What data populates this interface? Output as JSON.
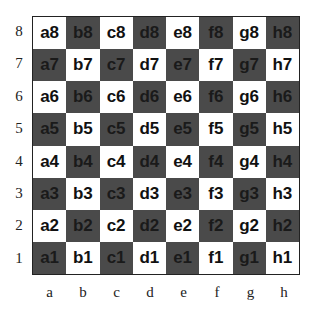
{
  "colors": {
    "light": "#ffffff",
    "dark": "#4a4a4a",
    "border": "#222222"
  },
  "ranks": [
    "8",
    "7",
    "6",
    "5",
    "4",
    "3",
    "2",
    "1"
  ],
  "files": [
    "a",
    "b",
    "c",
    "d",
    "e",
    "f",
    "g",
    "h"
  ],
  "squares": [
    [
      "a8",
      "b8",
      "c8",
      "d8",
      "e8",
      "f8",
      "g8",
      "h8"
    ],
    [
      "a7",
      "b7",
      "c7",
      "d7",
      "e7",
      "f7",
      "g7",
      "h7"
    ],
    [
      "a6",
      "b6",
      "c6",
      "d6",
      "e6",
      "f6",
      "g6",
      "h6"
    ],
    [
      "a5",
      "b5",
      "c5",
      "d5",
      "e5",
      "f5",
      "g5",
      "h5"
    ],
    [
      "a4",
      "b4",
      "c4",
      "d4",
      "e4",
      "f4",
      "g4",
      "h4"
    ],
    [
      "a3",
      "b3",
      "c3",
      "d3",
      "e3",
      "f3",
      "g3",
      "h3"
    ],
    [
      "a2",
      "b2",
      "c2",
      "d2",
      "e2",
      "f2",
      "g2",
      "h2"
    ],
    [
      "a1",
      "b1",
      "c1",
      "d1",
      "e1",
      "f1",
      "g1",
      "h1"
    ]
  ]
}
